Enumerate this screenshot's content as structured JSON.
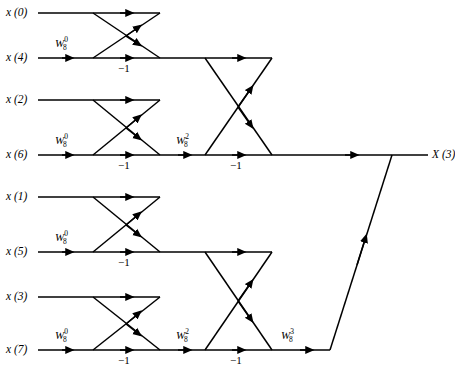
{
  "figure": {
    "type": "signal-flow-graph",
    "width": 455,
    "height": 366,
    "line_color": "#000000",
    "background_color": "#ffffff"
  },
  "inputs": [
    {
      "id": "x0",
      "label": "x (0)",
      "row_y": 13
    },
    {
      "id": "x4",
      "label": "x (4)",
      "row_y": 58
    },
    {
      "id": "x2",
      "label": "x (2)",
      "row_y": 100
    },
    {
      "id": "x6",
      "label": "x (6)",
      "row_y": 155
    },
    {
      "id": "x1",
      "label": "x (1)",
      "row_y": 197
    },
    {
      "id": "x5",
      "label": "x (5)",
      "row_y": 252
    },
    {
      "id": "x3",
      "label": "x (3)",
      "row_y": 297
    },
    {
      "id": "x7",
      "label": "x (7)",
      "row_y": 350
    }
  ],
  "outputs": [
    {
      "id": "X3",
      "label": "X (3)",
      "row_y": 155
    }
  ],
  "twiddle_factors": [
    {
      "id": "tw-s1-r1",
      "base": "W",
      "sub": "8",
      "sup": "0",
      "x": 55,
      "y": 44
    },
    {
      "id": "tw-s1-r3",
      "base": "W",
      "sub": "8",
      "sup": "0",
      "x": 55,
      "y": 141
    },
    {
      "id": "tw-s1-r5",
      "base": "W",
      "sub": "8",
      "sup": "0",
      "x": 55,
      "y": 238
    },
    {
      "id": "tw-s1-r7",
      "base": "W",
      "sub": "8",
      "sup": "0",
      "x": 55,
      "y": 336
    },
    {
      "id": "tw-s2-r3",
      "base": "W",
      "sub": "8",
      "sup": "2",
      "x": 176,
      "y": 141
    },
    {
      "id": "tw-s2-r7",
      "base": "W",
      "sub": "8",
      "sup": "2",
      "x": 176,
      "y": 336
    },
    {
      "id": "tw-s3-r7",
      "base": "W",
      "sub": "8",
      "sup": "3",
      "x": 281,
      "y": 336
    }
  ],
  "minus_one_labels": [
    {
      "id": "m1",
      "label": "−1",
      "x": 118,
      "y": 63
    },
    {
      "id": "m2",
      "label": "−1",
      "x": 118,
      "y": 160
    },
    {
      "id": "m3",
      "label": "−1",
      "x": 118,
      "y": 257
    },
    {
      "id": "m4",
      "label": "−1",
      "x": 118,
      "y": 355
    },
    {
      "id": "m5",
      "label": "−1",
      "x": 230,
      "y": 160
    },
    {
      "id": "m6",
      "label": "−1",
      "x": 230,
      "y": 355
    }
  ],
  "columns": {
    "input_line_start": 38,
    "stage1_left": 93,
    "stage1_right": 160,
    "stage2_left": 205,
    "stage2_right": 272,
    "stage3_left": 330,
    "stage3_right": 392,
    "output_line_end": 428
  },
  "stages": [
    {
      "name": "stage-1",
      "butterflies": [
        {
          "top_row": 13,
          "bottom_row": 58
        },
        {
          "top_row": 100,
          "bottom_row": 155
        },
        {
          "top_row": 197,
          "bottom_row": 252
        },
        {
          "top_row": 297,
          "bottom_row": 350
        }
      ]
    },
    {
      "name": "stage-2",
      "butterflies": [
        {
          "top_row": 58,
          "bottom_row": 155
        },
        {
          "top_row": 252,
          "bottom_row": 350
        }
      ]
    },
    {
      "name": "stage-3",
      "butterflies": [
        {
          "top_row": 155,
          "bottom_row": 350
        }
      ]
    }
  ]
}
